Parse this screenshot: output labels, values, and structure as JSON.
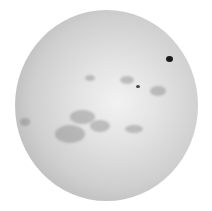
{
  "image": {
    "subject": "solar-disk",
    "background": "#ffffff",
    "disk": {
      "left": 15,
      "top": 10,
      "width": 183,
      "height": 191
    },
    "sunspots": [
      {
        "x": 166,
        "y": 56,
        "w": 7,
        "h": 6,
        "color": "#1a1a1a"
      },
      {
        "x": 136,
        "y": 85,
        "w": 4,
        "h": 3,
        "color": "#444444"
      }
    ],
    "plages": [
      {
        "x": 85,
        "y": 75,
        "w": 10,
        "h": 6
      },
      {
        "x": 120,
        "y": 76,
        "w": 14,
        "h": 8
      },
      {
        "x": 150,
        "y": 86,
        "w": 16,
        "h": 10
      },
      {
        "x": 70,
        "y": 110,
        "w": 25,
        "h": 14
      },
      {
        "x": 55,
        "y": 125,
        "w": 30,
        "h": 18
      },
      {
        "x": 90,
        "y": 120,
        "w": 20,
        "h": 12
      },
      {
        "x": 125,
        "y": 125,
        "w": 18,
        "h": 8
      },
      {
        "x": 20,
        "y": 118,
        "w": 10,
        "h": 8
      }
    ]
  }
}
